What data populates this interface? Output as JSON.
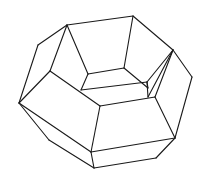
{
  "figure": {
    "stroke_color": "#1a1a1a",
    "background": "#ffffff",
    "edges": [
      [
        67,
        25,
        133,
        16
      ],
      [
        133,
        16,
        173,
        50
      ],
      [
        173,
        50,
        192,
        77
      ],
      [
        192,
        77,
        175,
        138
      ],
      [
        175,
        138,
        156,
        158
      ],
      [
        156,
        158,
        94,
        168
      ],
      [
        94,
        168,
        49,
        140
      ],
      [
        49,
        140,
        19,
        103
      ],
      [
        19,
        103,
        38,
        45
      ],
      [
        38,
        45,
        67,
        25
      ],
      [
        67,
        25,
        50,
        71
      ],
      [
        50,
        71,
        19,
        103
      ],
      [
        67,
        25,
        88,
        74
      ],
      [
        133,
        16,
        124,
        68
      ],
      [
        88,
        74,
        124,
        68
      ],
      [
        124,
        68,
        148,
        88
      ],
      [
        50,
        71,
        100,
        106
      ],
      [
        100,
        106,
        155,
        97
      ],
      [
        155,
        97,
        175,
        138
      ],
      [
        100,
        106,
        91,
        152
      ],
      [
        91,
        152,
        94,
        168
      ],
      [
        91,
        152,
        175,
        138
      ],
      [
        19,
        103,
        91,
        152
      ],
      [
        81,
        90,
        88,
        74
      ],
      [
        81,
        90,
        147,
        82
      ],
      [
        147,
        82,
        173,
        50
      ],
      [
        173,
        50,
        148,
        97
      ],
      [
        148,
        97,
        147,
        82
      ],
      [
        173,
        50,
        155,
        97
      ],
      [
        148,
        88,
        147,
        82
      ]
    ]
  }
}
